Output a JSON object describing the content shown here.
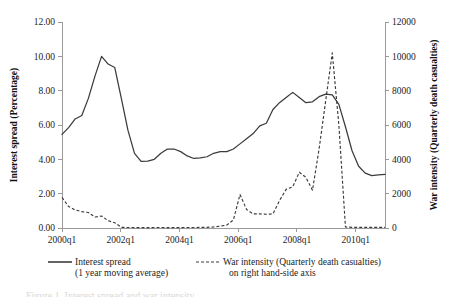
{
  "chart_data": {
    "type": "line",
    "title": "",
    "xlabel": "",
    "ylabel": "Interest spread (Percentage)",
    "y2label": "War intensity (Quarterly death casualties)",
    "grid": false,
    "legend_position": "bottom",
    "ylim": [
      0,
      12
    ],
    "y2lim": [
      0,
      12000
    ],
    "ytick_labels": [
      "0.00",
      "2.00",
      "4.00",
      "6.00",
      "8.00",
      "10.00",
      "12.00"
    ],
    "ytick_values": [
      0,
      2,
      4,
      6,
      8,
      10,
      12
    ],
    "y2tick_labels": [
      "0",
      "2000",
      "4000",
      "6000",
      "8000",
      "10000",
      "12000"
    ],
    "y2tick_values": [
      0,
      2000,
      4000,
      6000,
      8000,
      10000,
      12000
    ],
    "xtick_labels": [
      "2000q1",
      "2002q1",
      "2004q1",
      "2006q1",
      "2008q1",
      "2010q1"
    ],
    "xtick_values": [
      0,
      8,
      16,
      24,
      32,
      40
    ],
    "x": [
      0,
      1,
      2,
      3,
      4,
      5,
      6,
      7,
      8,
      9,
      10,
      11,
      12,
      13,
      14,
      15,
      16,
      17,
      18,
      19,
      20,
      21,
      22,
      23,
      24,
      25,
      26,
      27,
      28,
      29,
      30,
      31,
      32,
      33,
      34,
      35,
      36,
      37,
      38,
      39,
      40,
      41,
      42,
      43,
      44
    ],
    "x_labels": [
      "2000q1",
      "2000q2",
      "2000q3",
      "2000q4",
      "2001q1",
      "2001q2",
      "2001q3",
      "2001q4",
      "2002q1",
      "2002q2",
      "2002q3",
      "2002q4",
      "2003q1",
      "2003q2",
      "2003q3",
      "2003q4",
      "2004q1",
      "2004q2",
      "2004q3",
      "2004q4",
      "2005q1",
      "2005q2",
      "2005q3",
      "2005q4",
      "2006q1",
      "2006q2",
      "2006q3",
      "2006q4",
      "2007q1",
      "2007q2",
      "2007q3",
      "2007q4",
      "2008q1",
      "2008q2",
      "2008q3",
      "2008q4",
      "2009q1",
      "2009q2",
      "2009q3",
      "2009q4",
      "2010q1",
      "2010q2",
      "2010q3",
      "2010q4",
      "2011q1"
    ],
    "series": [
      {
        "name": "Interest spread (1 year moving average)",
        "axis": "left",
        "style": "solid",
        "units": "percentage",
        "values": [
          5.45,
          5.85,
          6.35,
          6.55,
          7.55,
          8.85,
          10.0,
          9.55,
          9.35,
          7.55,
          5.7,
          4.35,
          3.88,
          3.9,
          4.0,
          4.35,
          4.6,
          4.6,
          4.45,
          4.2,
          4.05,
          4.08,
          4.15,
          4.35,
          4.45,
          4.45,
          4.6,
          4.9,
          5.2,
          5.5,
          5.95,
          6.1,
          6.9,
          7.3,
          7.6,
          7.9,
          7.6,
          7.3,
          7.35,
          7.65,
          7.8,
          7.75,
          7.2,
          5.9,
          4.5
        ]
      },
      {
        "name": "War intensity (Quarterly death casualties)",
        "axis": "right",
        "style": "dashed",
        "units": "deaths per quarter",
        "values": [
          1780,
          1250,
          1050,
          950,
          900,
          640,
          700,
          420,
          310,
          40,
          30,
          25,
          20,
          20,
          30,
          30,
          20,
          20,
          25,
          30,
          30,
          35,
          40,
          60,
          110,
          170,
          470,
          1950,
          1080,
          820,
          820,
          800,
          820,
          1600,
          2250,
          2400,
          3250,
          2950,
          2200,
          4600,
          7400,
          10200,
          6000,
          60,
          40
        ]
      }
    ],
    "solid_tail_values": [
      3.6,
      3.2,
      3.05,
      3.1,
      3.12
    ],
    "annotations": []
  },
  "axes": {
    "left_title": "Interest spread (Percentage)",
    "right_title": "War intensity (Quarterly death casualties)"
  },
  "legend": {
    "items": [
      {
        "line1": "Interest spread",
        "line2": "(1 year moving average)",
        "style": "solid"
      },
      {
        "line1": "War intensity (Quarterly death casualties)",
        "line2": "on right hand-side axis",
        "style": "dashed"
      }
    ]
  },
  "caption": {
    "partial_text": "Figure 1. Interest spread and war intensity"
  }
}
